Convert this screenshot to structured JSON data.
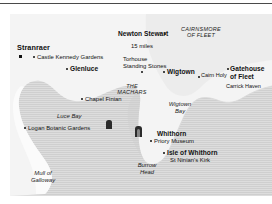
{
  "figure": {
    "kind": "locator-map",
    "region": "Dumfries and Galloway, south-west Scotland",
    "colors": {
      "sea": "#cfcfcf",
      "land": "#f4f4f4",
      "text": "#111111",
      "rule": "#4a4a4a"
    }
  },
  "scale": {
    "distance_label": "15 miles"
  },
  "towns": [
    {
      "name": "Stranraer",
      "style": "bold-big",
      "marker": "square"
    },
    {
      "name": "Glenluce",
      "style": "bold",
      "marker": "dot"
    },
    {
      "name": "Newton Stewart",
      "style": "bold",
      "marker": "dot"
    },
    {
      "name": "Wigtown",
      "style": "bold",
      "marker": "dot"
    },
    {
      "name": "Gatehouse of Fleet",
      "style": "bold",
      "marker": "dot"
    },
    {
      "name": "Whithorn",
      "style": "bold",
      "marker": "dot"
    },
    {
      "name": "Isle of Whithorn",
      "style": "bold",
      "marker": "dot"
    }
  ],
  "sites": [
    {
      "name": "Castle Kennedy Gardens",
      "marker": "dot"
    },
    {
      "name": "Torhouse Standing Stones",
      "marker": "dot"
    },
    {
      "name": "Cairn Holy",
      "marker": "dot"
    },
    {
      "name": "Chapel Finian",
      "marker": "dot"
    },
    {
      "name": "Logan Botanic Gardens",
      "marker": "dot"
    },
    {
      "name": "Priory Museum",
      "marker": "dot"
    },
    {
      "name": "St Ninian's Kirk",
      "marker": "none"
    },
    {
      "name": "Carrick Haven",
      "marker": "none"
    }
  ],
  "areas": [
    {
      "name": "CAIRNSMORE OF FLEET",
      "line1": "CAIRNSMORE",
      "line2": "OF FLEET",
      "style": "italic-caps"
    },
    {
      "name": "THE MACHARS",
      "line1": "THE",
      "line2": "MACHARS",
      "style": "italic-caps"
    }
  ],
  "water": [
    {
      "name": "Luce Bay",
      "style": "italic"
    },
    {
      "name": "Wigtown Bay",
      "line1": "Wigtown",
      "line2": "Bay",
      "style": "italic"
    }
  ],
  "headlands": [
    {
      "name": "Mull of Galloway",
      "line1": "Mull of",
      "line2": "Galloway",
      "style": "italic"
    },
    {
      "name": "Burrow Head",
      "line1": "Burrow",
      "line2": "Head",
      "style": "italic"
    }
  ],
  "torhouse": {
    "line1": "Torhouse",
    "line2": "Standing Stones"
  },
  "gatehouse": {
    "line1": "Gatehouse",
    "line2": "of Fleet"
  }
}
